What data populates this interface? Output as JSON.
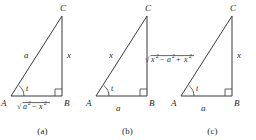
{
  "figure": {
    "stroke_color": "#3b3b3b",
    "text_color": "#231f20",
    "background": "#ffffff"
  },
  "panels": [
    {
      "caption": "(a)",
      "vertices": {
        "a": "A",
        "b": "B",
        "c": "C"
      },
      "angle_label": "t",
      "hypotenuse_label": "a",
      "vertical_label": "x",
      "base_label": {
        "radical": "√",
        "radicand_first": "a",
        "radicand_first_sup": "2",
        "operator": "−",
        "radicand_second": "x",
        "radicand_second_sup": "2",
        "plain": "√(a²−x²)"
      },
      "base_label_position": "under-base",
      "right_angle_at": "B"
    },
    {
      "caption": "(b)",
      "vertices": {
        "a": "A",
        "b": "B",
        "c": "C"
      },
      "angle_label": "t",
      "hypotenuse_label": "x",
      "base_label": "a",
      "vertical_label": {
        "radical": "√",
        "radicand_first": "x",
        "radicand_first_sup": "2",
        "operator": "−",
        "radicand_second": "a",
        "radicand_second_sup": "2",
        "plain": "√(x²−a²)"
      },
      "vertical_label_position": "right-of-vertical",
      "right_angle_at": "B"
    },
    {
      "caption": "(c)",
      "vertices": {
        "a": "A",
        "b": "B",
        "c": "C"
      },
      "angle_label": "t",
      "base_label": "a",
      "vertical_label": "x",
      "hypotenuse_label": {
        "radical": "√",
        "radicand_first": "a",
        "radicand_first_sup": "2",
        "operator": "+",
        "radicand_second": "x",
        "radicand_second_sup": "2",
        "plain": "√(a²+x²)"
      },
      "hypotenuse_label_position": "left-of-hypotenuse",
      "right_angle_at": "B"
    }
  ]
}
